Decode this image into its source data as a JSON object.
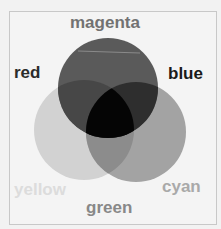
{
  "diagram": {
    "type": "venn-additive-color",
    "labels": {
      "magenta": "magenta",
      "red": "red",
      "blue": "blue",
      "yellow": "yellow",
      "cyan": "cyan",
      "green": "green"
    },
    "circles": [
      {
        "name": "top",
        "cx": 108,
        "cy": 88,
        "r": 50,
        "fill": "#555555"
      },
      {
        "name": "left",
        "cx": 84,
        "cy": 130,
        "r": 50,
        "fill": "#c9c9c9"
      },
      {
        "name": "right",
        "cx": 136,
        "cy": 132,
        "r": 50,
        "fill": "#9a9a9a"
      }
    ],
    "colors": {
      "magenta": "#777777",
      "red": "#333333",
      "blue": "#222222",
      "yellow": "#d8d8d8",
      "cyan": "#a8a8a8",
      "green": "#8a8a8a"
    }
  }
}
